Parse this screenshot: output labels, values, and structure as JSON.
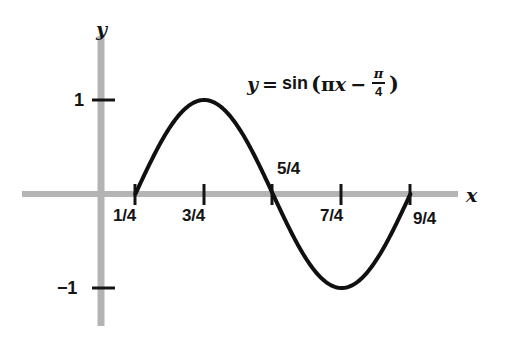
{
  "figure": {
    "background_color": "#ffffff",
    "width": 523,
    "height": 338
  },
  "equation": {
    "lhs": "y",
    "equals": "=",
    "function_name": "sin",
    "open_paren": "(",
    "pi_symbol": "π",
    "x_symbol": "x",
    "minus": "−",
    "fraction_numerator": "π",
    "fraction_denominator": "4",
    "close_paren": ")",
    "plain_text": "y = sin(πx − π/4)"
  },
  "axes": {
    "x_axis_label": "x",
    "y_axis_label": "y",
    "axis_color": "#b4b4b4",
    "tick_color": "#141414",
    "curve_color": "#101010",
    "x_ticks": [
      {
        "label": "1/4",
        "value": 0.25,
        "label_position": "below"
      },
      {
        "label": "3/4",
        "value": 0.75,
        "label_position": "below"
      },
      {
        "label": "5/4",
        "value": 1.25,
        "label_position": "above"
      },
      {
        "label": "7/4",
        "value": 1.75,
        "label_position": "below"
      },
      {
        "label": "9/4",
        "value": 2.25,
        "label_position": "below"
      }
    ],
    "y_ticks": [
      {
        "label": "1",
        "value": 1
      },
      {
        "label": "−1",
        "value": -1
      }
    ]
  },
  "chart_data": {
    "type": "line",
    "title": "",
    "subtitle": "",
    "xlabel": "x",
    "ylabel": "y",
    "annotations": [
      "y = sin(πx − π/4)"
    ],
    "legend": [],
    "legend_position": "none",
    "grid": false,
    "xlim": [
      -0.55,
      2.9
    ],
    "ylim": [
      -1.55,
      1.55
    ],
    "xticks": [
      0.25,
      0.75,
      1.25,
      1.75,
      2.25
    ],
    "xticklabels": [
      "1/4",
      "3/4",
      "5/4",
      "7/4",
      "9/4"
    ],
    "yticks": [
      -1,
      1
    ],
    "yticklabels": [
      "−1",
      "1"
    ],
    "series": [
      {
        "name": "y = sin(πx − π/4)",
        "formula": "sin(pi*x - pi/4)",
        "domain": [
          0.25,
          2.25
        ],
        "amplitude": 1,
        "period": 2,
        "phase_shift": 0.25,
        "color": "#101010",
        "linewidth": 4,
        "x": [
          0.25,
          0.375,
          0.5,
          0.625,
          0.75,
          0.875,
          1.0,
          1.125,
          1.25,
          1.375,
          1.5,
          1.625,
          1.75,
          1.875,
          2.0,
          2.125,
          2.25
        ],
        "y": [
          0,
          0.3827,
          0.7071,
          0.9239,
          1.0,
          0.9239,
          0.7071,
          0.3827,
          0,
          -0.3827,
          -0.7071,
          -0.9239,
          -1.0,
          -0.9239,
          -0.7071,
          -0.3827,
          0
        ]
      }
    ],
    "key_points": [
      {
        "label": "zero-rising",
        "x": 0.25,
        "y": 0
      },
      {
        "label": "maximum",
        "x": 0.75,
        "y": 1
      },
      {
        "label": "zero-falling",
        "x": 1.25,
        "y": 0
      },
      {
        "label": "minimum",
        "x": 1.75,
        "y": -1
      },
      {
        "label": "zero-rising",
        "x": 2.25,
        "y": 0
      }
    ]
  }
}
